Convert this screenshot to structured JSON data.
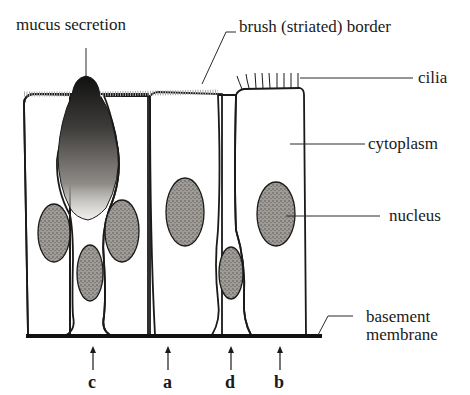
{
  "diagram": {
    "labels": {
      "mucus_secretion": "mucus secretion",
      "brush_border": "brush (striated) border",
      "cilia": "cilia",
      "cytoplasm": "cytoplasm",
      "nucleus": "nucleus",
      "basement_line1": "basement",
      "basement_line2": "membrane"
    },
    "cell_markers": [
      {
        "letter": "c",
        "x": 93
      },
      {
        "letter": "a",
        "x": 168
      },
      {
        "letter": "d",
        "x": 231
      },
      {
        "letter": "b",
        "x": 280
      }
    ],
    "colors": {
      "ink": "#1a1a1a",
      "cytoplasm_fill": "#f1efec",
      "nucleus_fill": "#8a8682",
      "mucus_fill": "#3a3836",
      "background": "#ffffff"
    }
  }
}
